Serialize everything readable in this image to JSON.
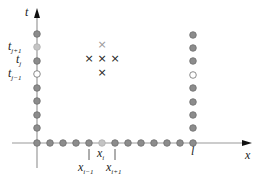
{
  "colors": {
    "axis": "#9a9a9a",
    "arrow": "#111111",
    "node_fill": "#8c8c8c",
    "node_stroke": "#6e6e6e",
    "node_light_fill": "#c4c4c4",
    "node_hollow_fill": "#ffffff",
    "stencil_mark": "#222222",
    "stencil_mark_light": "#9a9a9a",
    "text": "#222222"
  },
  "axes": {
    "x_label": "x",
    "t_label": "t",
    "boundary_label": "l"
  },
  "t_labels": [
    {
      "base": "t",
      "sub": "j+1"
    },
    {
      "base": "t",
      "sub": "j"
    },
    {
      "base": "t",
      "sub": "j−1"
    }
  ],
  "x_labels": [
    {
      "base": "x",
      "sub": "i−1"
    },
    {
      "base": "x",
      "sub": "i"
    },
    {
      "base": "x",
      "sub": "i+1"
    }
  ],
  "stencil": {
    "marks": [
      "×",
      "×",
      "×",
      "×",
      "×"
    ],
    "description": "five-point stencil: (i, j+1) light, (i−1, j), (i, j), (i+1, j), (i, j−1)"
  },
  "left_boundary_nodes": [
    "filled",
    "light",
    "filled",
    "hollow",
    "filled",
    "filled",
    "filled",
    "filled"
  ],
  "right_boundary_nodes": [
    "filled",
    "filled",
    "filled",
    "hollow",
    "filled",
    "filled",
    "filled",
    "filled",
    "filled"
  ],
  "initial_nodes": [
    "filled",
    "filled",
    "filled",
    "filled",
    "filled",
    "light",
    "filled",
    "filled",
    "filled",
    "filled",
    "filled",
    "filled",
    "filled"
  ]
}
